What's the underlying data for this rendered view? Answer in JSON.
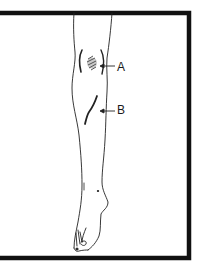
{
  "figure": {
    "type": "medical illustration",
    "border_color": "#111111",
    "line_color": "#222222",
    "background": "#ffffff"
  },
  "labels": {
    "a": {
      "text": "A",
      "points_to": "bruised area on knee/shin with hatching"
    },
    "b": {
      "text": "B",
      "points_to": "curved scar/laceration on shin"
    }
  }
}
